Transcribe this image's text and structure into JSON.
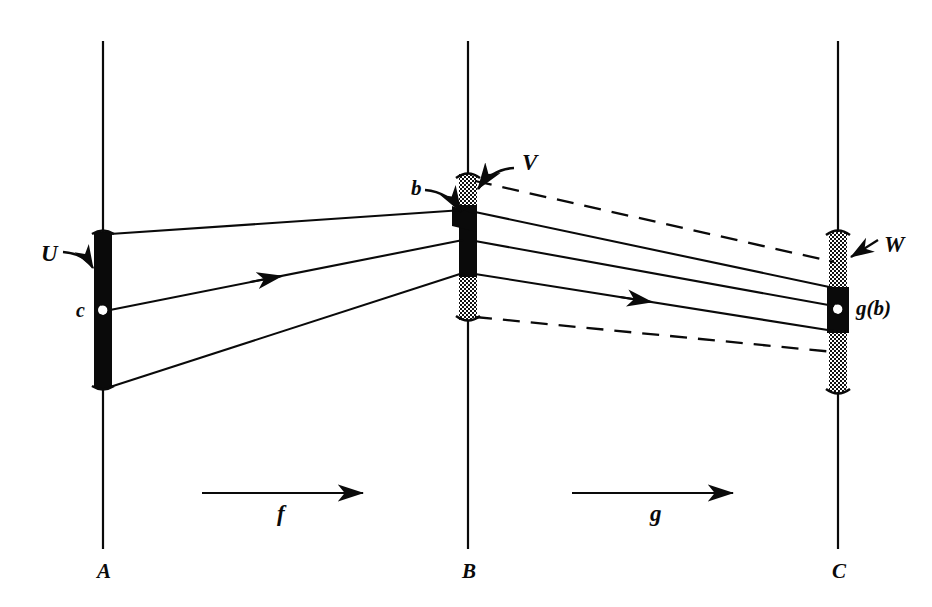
{
  "figure": {
    "background_color": "#ffffff",
    "ink_color": "#0a0a0a"
  },
  "lines": [
    {
      "id": "A",
      "label": "A",
      "x": 103,
      "y_top": 41,
      "y_bottom": 549,
      "label_x": 97,
      "label_y": 578
    },
    {
      "id": "B",
      "label": "B",
      "x": 468,
      "y_top": 41,
      "y_bottom": 549,
      "label_x": 462,
      "label_y": 578
    },
    {
      "id": "C",
      "label": "C",
      "x": 838,
      "y_top": 41,
      "y_bottom": 549,
      "label_x": 832,
      "label_y": 578
    }
  ],
  "sets": {
    "U": {
      "label": "U",
      "on_line": "A",
      "style": "solid-black-bar",
      "x": 94,
      "y": 232,
      "width": 18,
      "height": 156,
      "label_x": 41,
      "label_y": 261
    },
    "V": {
      "label": "V",
      "on_line": "B",
      "style": "stippled-bar",
      "x": 459,
      "y": 174,
      "width": 18,
      "height": 146,
      "label_x": 522,
      "label_y": 170
    },
    "W": {
      "label": "W",
      "on_line": "C",
      "style": "stippled-bar",
      "x": 829,
      "y": 232,
      "width": 18,
      "height": 160,
      "label_x": 884,
      "label_y": 252
    }
  },
  "images": {
    "f_of_U": {
      "description": "solid black image of U inside V on line B",
      "on_line": "B",
      "x": 459,
      "y": 205,
      "width": 18,
      "height": 72
    },
    "g_of_b": {
      "label": "g(b)",
      "on_line": "C",
      "x": 827,
      "y": 287,
      "width": 22,
      "height": 46,
      "label_x": 856,
      "label_y": 315
    }
  },
  "points": {
    "c": {
      "label": "c",
      "on_line": "A",
      "x": 103,
      "y": 310,
      "label_x": 76,
      "label_y": 317
    },
    "b": {
      "label": "b",
      "on_line": "B",
      "x": 468,
      "y": 212,
      "label_x": 411,
      "label_y": 195
    },
    "g_b_dot": {
      "on_line": "C",
      "x": 838,
      "y": 309
    }
  },
  "maps": [
    {
      "id": "f",
      "label": "f",
      "from": "A",
      "to": "B",
      "arrow_x1": 202,
      "arrow_x2": 363,
      "arrow_y": 493,
      "label_x": 277,
      "label_y": 521
    },
    {
      "id": "g",
      "label": "g",
      "from": "B",
      "to": "C",
      "arrow_x1": 572,
      "arrow_x2": 733,
      "arrow_y": 493,
      "label_x": 650,
      "label_y": 521
    }
  ],
  "connectors": {
    "a_to_b_solid": [
      {
        "x1": 110,
        "y1": 234,
        "x2": 463,
        "y2": 210,
        "arrowhead": false
      },
      {
        "x1": 110,
        "y1": 310,
        "x2": 463,
        "y2": 240,
        "arrowhead": true,
        "arrow_t": 0.46
      },
      {
        "x1": 110,
        "y1": 387,
        "x2": 463,
        "y2": 273,
        "arrowhead": false
      }
    ],
    "b_to_c_solid": [
      {
        "x1": 475,
        "y1": 212,
        "x2": 834,
        "y2": 288,
        "arrowhead": false
      },
      {
        "x1": 475,
        "y1": 241,
        "x2": 834,
        "y2": 306,
        "arrowhead": false
      },
      {
        "x1": 475,
        "y1": 274,
        "x2": 834,
        "y2": 331,
        "arrowhead": true,
        "arrow_t": 0.42
      }
    ],
    "b_to_c_dashed": [
      {
        "x1": 475,
        "y1": 181,
        "x2": 834,
        "y2": 262
      },
      {
        "x1": 475,
        "y1": 317,
        "x2": 834,
        "y2": 352
      }
    ]
  },
  "callouts": [
    {
      "id": "U",
      "label": "U",
      "tip_x": 93,
      "tip_y": 268
    },
    {
      "id": "b",
      "label": "b",
      "tip_x": 462,
      "tip_y": 213
    },
    {
      "id": "V",
      "label": "V",
      "tip_x": 476,
      "tip_y": 190
    },
    {
      "id": "W",
      "label": "W",
      "tip_x": 849,
      "tip_y": 258
    }
  ]
}
